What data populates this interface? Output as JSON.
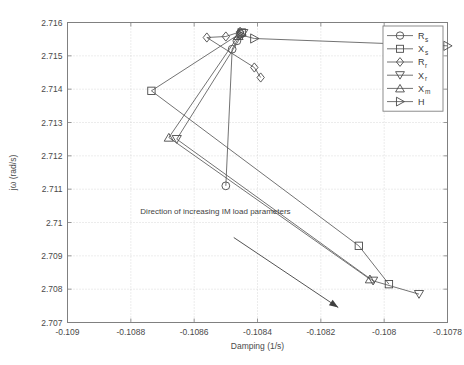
{
  "chart_data": {
    "type": "line",
    "title": "",
    "xlabel": "Damping (1/s)",
    "ylabel": "jω (rad/s)",
    "xlim": [
      -0.109,
      -0.1078
    ],
    "ylim": [
      2.707,
      2.716
    ],
    "xticks": [
      "-0.109",
      "-0.1088",
      "-0.1086",
      "-0.1084",
      "-0.1082",
      "-0.108",
      "-0.1078"
    ],
    "xtick_values": [
      -0.109,
      -0.1088,
      -0.1086,
      -0.1084,
      -0.1082,
      -0.108,
      -0.1078
    ],
    "yticks": [
      "2.707",
      "2.708",
      "2.709",
      "2.71",
      "2.711",
      "2.712",
      "2.713",
      "2.714",
      "2.715",
      "2.716"
    ],
    "ytick_values": [
      2.707,
      2.708,
      2.709,
      2.71,
      2.711,
      2.712,
      2.713,
      2.714,
      2.715,
      2.716
    ],
    "grid": true,
    "legend_position": "top-right",
    "annotations": [
      {
        "text": "Direction of increasing IM load parameters",
        "x": -0.10877,
        "y": 2.71025,
        "arrow_from": [
          -0.108475,
          2.70955
        ],
        "arrow_to": [
          -0.108145,
          2.70745
        ]
      }
    ],
    "series": [
      {
        "name": "R_s",
        "label": "R",
        "sub": "s",
        "marker": "circle",
        "points": [
          [
            -0.108455,
            2.71565
          ],
          [
            -0.108465,
            2.71545
          ],
          [
            -0.10848,
            2.7152
          ],
          [
            -0.1085,
            2.7111
          ]
        ]
      },
      {
        "name": "X_s",
        "label": "X",
        "sub": "s",
        "marker": "square",
        "points": [
          [
            -0.10845,
            2.7157
          ],
          [
            -0.108735,
            2.71395
          ],
          [
            -0.10808,
            2.7093
          ],
          [
            -0.107985,
            2.70815
          ]
        ]
      },
      {
        "name": "R_r",
        "label": "R",
        "sub": "r",
        "marker": "diamond",
        "points": [
          [
            -0.108455,
            2.71572
          ],
          [
            -0.1085,
            2.71558
          ],
          [
            -0.10856,
            2.71555
          ],
          [
            -0.10841,
            2.71465
          ],
          [
            -0.10839,
            2.71435
          ]
        ]
      },
      {
        "name": "X_r",
        "label": "X",
        "sub": "r",
        "marker": "triangle-down",
        "points": [
          [
            -0.108445,
            2.71568
          ],
          [
            -0.108655,
            2.7125
          ],
          [
            -0.108035,
            2.70825
          ],
          [
            -0.10789,
            2.70785
          ]
        ]
      },
      {
        "name": "X_m",
        "label": "X",
        "sub": "m",
        "marker": "triangle-up",
        "points": [
          [
            -0.10846,
            2.7156
          ],
          [
            -0.10868,
            2.71255
          ],
          [
            -0.108045,
            2.7083
          ]
        ]
      },
      {
        "name": "H",
        "label": "H",
        "sub": "",
        "marker": "triangle-right",
        "points": [
          [
            -0.10845,
            2.71562
          ],
          [
            -0.10841,
            2.71552
          ],
          [
            -0.1078,
            2.7153
          ]
        ]
      }
    ]
  },
  "legend": {
    "entries": [
      {
        "label": "R",
        "sub": "s",
        "marker": "circle"
      },
      {
        "label": "X",
        "sub": "s",
        "marker": "square"
      },
      {
        "label": "R",
        "sub": "r",
        "marker": "diamond"
      },
      {
        "label": "X",
        "sub": "r",
        "marker": "triangle-down"
      },
      {
        "label": "X",
        "sub": "m",
        "marker": "triangle-up"
      },
      {
        "label": "H",
        "sub": "",
        "marker": "triangle-right"
      }
    ]
  },
  "colors": {
    "line": "#5a5a5a",
    "marker": "#4a4a4a",
    "grid": "#c8c8c8",
    "axis": "#808080",
    "text": "#4a4a4a",
    "background": "#ffffff"
  }
}
